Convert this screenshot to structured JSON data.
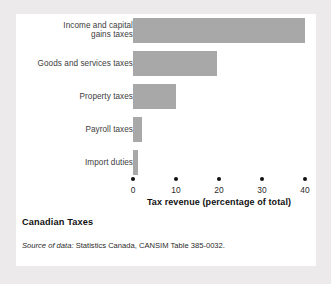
{
  "figure": {
    "caption_title": "Canadian Taxes",
    "source_prefix": "Source of data:",
    "source_text": "Statistics Canada, CANSIM Table 385-0032."
  },
  "colors": {
    "bar_fill": "#a8a8a8",
    "panel_background": "#ffffff",
    "page_background": "#eceaea",
    "text": "#2b2b2b"
  },
  "chart_data": {
    "type": "bar",
    "orientation": "horizontal",
    "title": "Canadian Taxes",
    "xlabel": "Tax revenue (percentage of total)",
    "ylabel": "",
    "categories": [
      "Income and capital gains taxes",
      "Goods and services taxes",
      "Property taxes",
      "Payroll taxes",
      "Import duties"
    ],
    "category_lines": [
      [
        "Income and capital",
        "gains taxes"
      ],
      [
        "Goods and services taxes"
      ],
      [
        "Property taxes"
      ],
      [
        "Payroll taxes"
      ],
      [
        "Import duties"
      ]
    ],
    "values": [
      40,
      19.5,
      10,
      2,
      1.2
    ],
    "xlim": [
      0,
      40
    ],
    "xticks": [
      0,
      10,
      20,
      30,
      40
    ],
    "xtick_labels": [
      "0",
      "10",
      "20",
      "30",
      "40"
    ],
    "grid": false,
    "legend": false
  }
}
